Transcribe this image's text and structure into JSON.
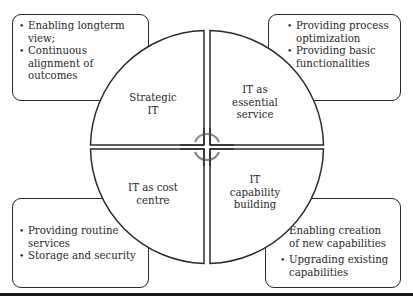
{
  "diagram": {
    "quadrants": [
      {
        "id": "top-left",
        "label_lines": [
          "Strategic",
          "IT"
        ]
      },
      {
        "id": "top-right",
        "label_lines": [
          "IT as",
          "essential",
          "service"
        ]
      },
      {
        "id": "bottom-left",
        "label_lines": [
          "IT as cost",
          "centre"
        ]
      },
      {
        "id": "bottom-right",
        "label_lines": [
          "IT",
          "capability",
          "building"
        ]
      }
    ],
    "boxes": {
      "top_left": {
        "items": [
          "Enabling longterm view;",
          "Continuous alignment of outcomes"
        ]
      },
      "top_right": {
        "items": [
          "Providing process optimization",
          "Providing basic functionalities"
        ]
      },
      "bottom_left": {
        "items": [
          "Providing routine services",
          "Storage and security"
        ]
      },
      "bottom_right": {
        "items": [
          "Enabling creation of new capabilities",
          "Upgrading existing capabilities"
        ]
      }
    },
    "colors": {
      "stroke": "#2b2b2b",
      "center_arcs": "#8a8a8a",
      "background": "#ffffff"
    }
  }
}
